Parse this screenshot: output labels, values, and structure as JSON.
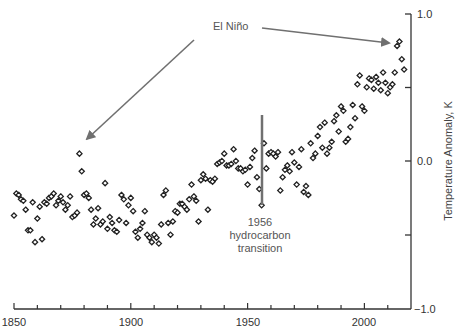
{
  "chart_data": {
    "type": "scatter",
    "title": "",
    "xlabel": "",
    "ylabel": "Temperature Anomaly, K",
    "xlim": [
      1850,
      2020
    ],
    "ylim": [
      -1.0,
      1.0
    ],
    "x_ticks_major": [
      1850,
      1900,
      1950,
      2000
    ],
    "x_tick_labels": [
      "1850",
      "1900",
      "1950",
      "2000"
    ],
    "x_ticks_minor_step": 10,
    "y_ticks": [
      -1.0,
      -0.5,
      0.0,
      0.5,
      1.0
    ],
    "y_tick_labels": [
      "-1.0",
      "",
      "0.0",
      "",
      "1.0"
    ],
    "y_axis_position": "right",
    "grid": false,
    "legend": null,
    "marker": "diamond",
    "annotations": [
      {
        "text": "El Niño",
        "type": "label",
        "x": 1940,
        "y": 0.93
      },
      {
        "text": "",
        "type": "arrow",
        "from": [
          1928,
          0.87
        ],
        "to": [
          1879,
          0.11
        ],
        "target": "El Niño 1878"
      },
      {
        "text": "",
        "type": "arrow",
        "from": [
          1937,
          0.83
        ],
        "to": [
          2014,
          0.75
        ],
        "target": "El Niño 2016"
      },
      {
        "text": "1956\nhydrocarbon\ntransition",
        "type": "label",
        "x": 1956,
        "y": -0.55
      },
      {
        "text": "",
        "type": "vline",
        "x": 1956,
        "y_range": [
          -0.3,
          0.31
        ]
      }
    ],
    "series": [
      {
        "name": "Annual global temperature anomaly",
        "x": [
          1850,
          1851,
          1852,
          1853,
          1854,
          1855,
          1856,
          1857,
          1858,
          1859,
          1860,
          1861,
          1862,
          1863,
          1864,
          1865,
          1866,
          1867,
          1868,
          1869,
          1870,
          1871,
          1872,
          1873,
          1874,
          1875,
          1876,
          1877,
          1878,
          1879,
          1880,
          1881,
          1882,
          1883,
          1884,
          1885,
          1886,
          1887,
          1888,
          1889,
          1890,
          1891,
          1892,
          1893,
          1894,
          1895,
          1896,
          1897,
          1898,
          1899,
          1900,
          1901,
          1902,
          1903,
          1904,
          1905,
          1906,
          1907,
          1908,
          1909,
          1910,
          1911,
          1912,
          1913,
          1914,
          1915,
          1916,
          1917,
          1918,
          1919,
          1920,
          1921,
          1922,
          1923,
          1924,
          1925,
          1926,
          1927,
          1928,
          1929,
          1930,
          1931,
          1932,
          1933,
          1934,
          1935,
          1936,
          1937,
          1938,
          1939,
          1940,
          1941,
          1942,
          1943,
          1944,
          1945,
          1946,
          1947,
          1948,
          1949,
          1950,
          1951,
          1952,
          1953,
          1954,
          1955,
          1956,
          1957,
          1958,
          1959,
          1960,
          1961,
          1962,
          1963,
          1964,
          1965,
          1966,
          1967,
          1968,
          1969,
          1970,
          1971,
          1972,
          1973,
          1974,
          1975,
          1976,
          1977,
          1978,
          1979,
          1980,
          1981,
          1982,
          1983,
          1984,
          1985,
          1986,
          1987,
          1988,
          1989,
          1990,
          1991,
          1992,
          1993,
          1994,
          1995,
          1996,
          1997,
          1998,
          1999,
          2000,
          2001,
          2002,
          2003,
          2004,
          2005,
          2006,
          2007,
          2008,
          2009,
          2010,
          2011,
          2012,
          2013,
          2014,
          2015,
          2016,
          2017
        ],
        "values": [
          -0.37,
          -0.22,
          -0.23,
          -0.26,
          -0.27,
          -0.33,
          -0.47,
          -0.47,
          -0.28,
          -0.55,
          -0.39,
          -0.31,
          -0.53,
          -0.28,
          -0.29,
          -0.25,
          -0.24,
          -0.22,
          -0.3,
          -0.27,
          -0.24,
          -0.28,
          -0.33,
          -0.3,
          -0.24,
          -0.38,
          -0.37,
          -0.35,
          0.05,
          -0.07,
          -0.23,
          -0.22,
          -0.25,
          -0.33,
          -0.43,
          -0.39,
          -0.32,
          -0.43,
          -0.41,
          -0.15,
          -0.46,
          -0.38,
          -0.42,
          -0.47,
          -0.48,
          -0.4,
          -0.23,
          -0.26,
          -0.42,
          -0.3,
          -0.25,
          -0.34,
          -0.48,
          -0.52,
          -0.46,
          -0.42,
          -0.34,
          -0.5,
          -0.52,
          -0.55,
          -0.5,
          -0.52,
          -0.56,
          -0.43,
          -0.23,
          -0.2,
          -0.42,
          -0.5,
          -0.41,
          -0.34,
          -0.35,
          -0.29,
          -0.29,
          -0.31,
          -0.33,
          -0.26,
          -0.16,
          -0.24,
          -0.27,
          -0.41,
          -0.13,
          -0.09,
          -0.12,
          -0.33,
          -0.13,
          -0.14,
          -0.12,
          -0.02,
          -0.01,
          0.0,
          0.05,
          -0.03,
          -0.03,
          -0.02,
          0.08,
          0.0,
          -0.05,
          -0.05,
          -0.07,
          -0.06,
          -0.16,
          -0.04,
          0.02,
          0.07,
          -0.11,
          -0.19,
          -0.3,
          0.12,
          -0.05,
          0.05,
          0.06,
          0.05,
          0.03,
          0.06,
          -0.2,
          -0.11,
          -0.06,
          -0.03,
          -0.07,
          0.06,
          -0.01,
          -0.16,
          -0.04,
          0.08,
          -0.21,
          -0.17,
          -0.23,
          0.12,
          0.02,
          0.05,
          0.17,
          0.23,
          0.09,
          0.26,
          0.05,
          0.09,
          0.13,
          0.27,
          0.31,
          0.2,
          0.37,
          0.34,
          0.13,
          0.15,
          0.23,
          0.38,
          0.29,
          0.52,
          0.58,
          0.37,
          0.34,
          0.5,
          0.56,
          0.55,
          0.49,
          0.57,
          0.53,
          0.48,
          0.6,
          0.53,
          0.46,
          0.5,
          0.52,
          0.6,
          0.78,
          0.81,
          0.69,
          0.62
        ]
      }
    ]
  },
  "labels": {
    "el_nino": "El Niño",
    "transition_year": "1956",
    "transition_line1": "hydrocarbon",
    "transition_line2": "transition",
    "y_axis_title": "Temperature Anomaly, K",
    "y_tick_top": "1.0",
    "y_tick_mid": "0.0",
    "y_tick_bottom": "−1.0",
    "x_tick_1850": "1850",
    "x_tick_1900": "1900",
    "x_tick_1950": "1950",
    "x_tick_2000": "2000"
  },
  "colors": {
    "axis": "#333333",
    "marker_stroke": "#222222",
    "annotation": "#707070",
    "annotation_text": "#555555"
  }
}
